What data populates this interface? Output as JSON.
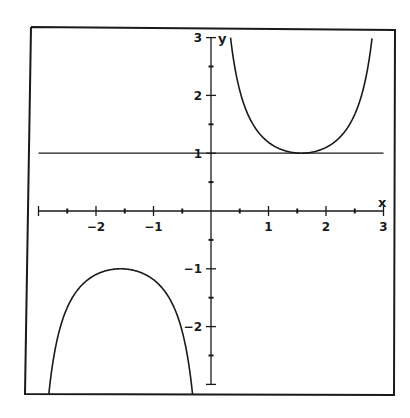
{
  "chart_data": {
    "type": "line",
    "title": "",
    "function": "y = csc(x) = 1/sin(x)",
    "xlabel": "x",
    "ylabel": "y",
    "xlim": [
      -3,
      3
    ],
    "ylim": [
      -3,
      3
    ],
    "x_ticks": [
      -2,
      -1,
      1,
      2,
      3
    ],
    "y_ticks": [
      3,
      2,
      1,
      -1,
      -2
    ],
    "minor_tick_step": 0.5,
    "grid": false,
    "legend": null,
    "series": [
      {
        "name": "csc(x)",
        "branches": [
          {
            "x_range": [
              0.34,
              2.8
            ],
            "extremum": {
              "x": 1.5708,
              "y": 1,
              "kind": "local minimum"
            }
          },
          {
            "x_range": [
              -2.82,
              -0.32
            ],
            "extremum": {
              "x": -1.5708,
              "y": -1,
              "kind": "local maximum"
            }
          }
        ]
      },
      {
        "name": "y = 1",
        "type": "horizontal line",
        "y": 1,
        "x_range": [
          -3,
          3
        ]
      }
    ],
    "sample_points": [
      {
        "x": 0.5,
        "y": 2.086
      },
      {
        "x": 1.0,
        "y": 1.188
      },
      {
        "x": 1.5708,
        "y": 1.0
      },
      {
        "x": 2.0,
        "y": 1.1
      },
      {
        "x": 2.5,
        "y": 1.671
      },
      {
        "x": -0.5,
        "y": -2.086
      },
      {
        "x": -1.0,
        "y": -1.188
      },
      {
        "x": -1.5708,
        "y": -1.0
      },
      {
        "x": -2.0,
        "y": -1.1
      },
      {
        "x": -2.5,
        "y": -1.671
      }
    ]
  },
  "labels": {
    "x_axis": "x",
    "y_axis": "y",
    "x_ticks": [
      "-2",
      "-1",
      "1",
      "2",
      "3"
    ],
    "y_ticks": [
      "3",
      "2",
      "1",
      "-1",
      "-2"
    ]
  },
  "colors": {
    "ink": "#1a1a1a",
    "background": "#ffffff"
  }
}
